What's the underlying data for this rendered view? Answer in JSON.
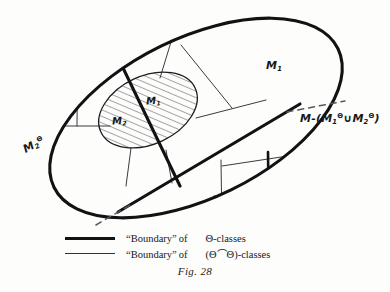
{
  "figure": {
    "caption_label": "Fig.",
    "caption_number": "28",
    "background_color": "#fdfdfb",
    "ink_color": "#121214",
    "thin_ink_color": "#33333a"
  },
  "diagram": {
    "type": "set-partition-diagram",
    "outer_region_name": "M",
    "inner_region_name": "hatched-ellipse",
    "labels": [
      {
        "id": "m1-outer",
        "text_main": "M",
        "sub": "1",
        "sup": "",
        "prefix": "",
        "suffix": ""
      },
      {
        "id": "m1-inner",
        "text_main": "M",
        "sub": "1",
        "sup": "",
        "prefix": "",
        "suffix": ""
      },
      {
        "id": "m2-inner",
        "text_main": "M",
        "sub": "2",
        "sup": "",
        "prefix": "",
        "suffix": ""
      },
      {
        "id": "m2-theta",
        "text_main": "M",
        "sub": "2",
        "sup": "Θ",
        "prefix": "",
        "suffix": ""
      },
      {
        "id": "complement",
        "text_main": "M",
        "sub": "",
        "sup": "",
        "prefix": "M-(",
        "suffix": ")"
      }
    ],
    "complement_label": {
      "lead": "M-(",
      "term1_base": "M",
      "term1_sub": "1",
      "term1_sup": "Θ",
      "operator": "∪",
      "term2_base": "M",
      "term2_sub": "2",
      "term2_sup": "Θ",
      "close": ")"
    }
  },
  "legend": {
    "rows": [
      {
        "style": "thick",
        "quoted": "“Boundary”",
        "of": "of",
        "classes": "Θ-classes"
      },
      {
        "style": "thin",
        "quoted": "“Boundary”",
        "of": "of",
        "classes": "(Θ⌒Θ)-classes"
      }
    ]
  }
}
